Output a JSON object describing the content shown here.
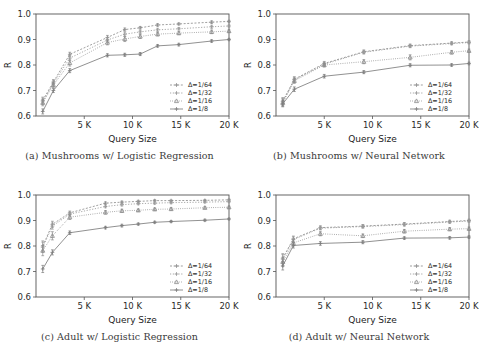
{
  "figure": {
    "background": "#ffffff",
    "panel_count": 4,
    "axis_color": "#555555"
  },
  "series_style": {
    "names": [
      "Δ=1/64",
      "Δ=1/32",
      "Δ=1/16",
      "Δ=1/8"
    ],
    "colors": [
      "#8e8e8e",
      "#9a9a9a",
      "#8a8a8a",
      "#7d7d7d"
    ],
    "dash": [
      "2,1.6",
      "1.2,1.6",
      "0.8,1.4",
      "none"
    ],
    "markers": [
      "plus",
      "plus",
      "triangle",
      "plus"
    ]
  },
  "axes_common": {
    "ylabel": "R",
    "xlabel": "Query Size",
    "ylim": [
      0.6,
      1.0
    ],
    "yticks": [
      "0.6",
      "0.7",
      "0.8",
      "0.9",
      "1.0"
    ],
    "ytick_values": [
      0.6,
      0.7,
      0.8,
      0.9,
      1.0
    ],
    "xlim": [
      0,
      20000
    ],
    "xticks": [
      "5 K",
      "10 K",
      "15 K",
      "20 K"
    ],
    "xtick_values": [
      5000,
      10000,
      15000,
      20000
    ],
    "grid": false,
    "legend_position": "lower right"
  },
  "chart_data": [
    {
      "type": "line",
      "panel": "a",
      "caption": "(a) Mushrooms w/ Logistic Regression",
      "title": "Mushrooms w/ Logistic Regression",
      "xlabel": "Query Size",
      "ylabel": "R",
      "xlim": [
        0,
        20000
      ],
      "ylim": [
        0.6,
        1.0
      ],
      "grid": false,
      "legend": [
        "Δ=1/64",
        "Δ=1/32",
        "Δ=1/16",
        "Δ=1/8"
      ],
      "x": [
        700,
        1800,
        3500,
        7400,
        9200,
        10800,
        12600,
        14800,
        18200,
        20000
      ],
      "series": [
        {
          "name": "Δ=1/64",
          "values": [
            0.662,
            0.733,
            0.842,
            0.908,
            0.939,
            0.946,
            0.957,
            0.961,
            0.968,
            0.971
          ],
          "err": [
            0.012,
            0.01,
            0.008,
            0.008,
            0.006,
            0.005,
            0.005,
            0.004,
            0.005,
            0.004
          ]
        },
        {
          "name": "Δ=1/32",
          "values": [
            0.658,
            0.728,
            0.827,
            0.898,
            0.921,
            0.93,
            0.938,
            0.942,
            0.95,
            0.953
          ],
          "err": [
            0.012,
            0.01,
            0.01,
            0.008,
            0.008,
            0.006,
            0.006,
            0.005,
            0.006,
            0.004
          ]
        },
        {
          "name": "Δ=1/16",
          "values": [
            0.652,
            0.722,
            0.808,
            0.888,
            0.902,
            0.912,
            0.921,
            0.925,
            0.93,
            0.933
          ],
          "err": [
            0.012,
            0.01,
            0.012,
            0.009,
            0.01,
            0.008,
            0.007,
            0.006,
            0.007,
            0.005
          ]
        },
        {
          "name": "Δ=1/8",
          "values": [
            0.618,
            0.7,
            0.778,
            0.838,
            0.84,
            0.843,
            0.875,
            0.88,
            0.894,
            0.9
          ],
          "err": [
            0.01,
            0.008,
            0.008,
            0.006,
            0.006,
            0.006,
            0.005,
            0.005,
            0.005,
            0.004
          ]
        }
      ]
    },
    {
      "type": "line",
      "panel": "b",
      "caption": "(b) Mushrooms w/ Neural Network",
      "title": "Mushrooms w/ Neural Network",
      "xlabel": "Query Size",
      "ylabel": "R",
      "xlim": [
        0,
        20000
      ],
      "ylim": [
        0.6,
        1.0
      ],
      "grid": false,
      "legend": [
        "Δ=1/64",
        "Δ=1/32",
        "Δ=1/16",
        "Δ=1/8"
      ],
      "x": [
        700,
        1900,
        5000,
        9100,
        13900,
        18200,
        20000
      ],
      "series": [
        {
          "name": "Δ=1/64",
          "values": [
            0.658,
            0.744,
            0.806,
            0.852,
            0.876,
            0.886,
            0.89
          ],
          "err": [
            0.014,
            0.01,
            0.008,
            0.007,
            0.006,
            0.005,
            0.005
          ]
        },
        {
          "name": "Δ=1/32",
          "values": [
            0.655,
            0.742,
            0.803,
            0.85,
            0.874,
            0.884,
            0.888
          ],
          "err": [
            0.014,
            0.01,
            0.008,
            0.007,
            0.006,
            0.005,
            0.005
          ]
        },
        {
          "name": "Δ=1/16",
          "values": [
            0.652,
            0.738,
            0.8,
            0.813,
            0.83,
            0.85,
            0.856
          ],
          "err": [
            0.014,
            0.01,
            0.008,
            0.008,
            0.01,
            0.007,
            0.006
          ]
        },
        {
          "name": "Δ=1/8",
          "values": [
            0.648,
            0.705,
            0.756,
            0.772,
            0.799,
            0.8,
            0.806
          ],
          "err": [
            0.012,
            0.009,
            0.007,
            0.006,
            0.006,
            0.005,
            0.005
          ]
        }
      ]
    },
    {
      "type": "line",
      "panel": "c",
      "caption": "(c) Adult w/ Logistic Regression",
      "title": "Adult w/ Logistic Regression",
      "xlabel": "Query Size",
      "ylabel": "R",
      "xlim": [
        0,
        20000
      ],
      "ylim": [
        0.6,
        1.0
      ],
      "grid": false,
      "legend": [
        "Δ=1/64",
        "Δ=1/32",
        "Δ=1/16",
        "Δ=1/8"
      ],
      "x": [
        700,
        1700,
        3500,
        7200,
        8900,
        10600,
        12300,
        14000,
        17500,
        20000
      ],
      "series": [
        {
          "name": "Δ=1/64",
          "values": [
            0.8,
            0.885,
            0.93,
            0.968,
            0.972,
            0.975,
            0.978,
            0.978,
            0.979,
            0.981
          ],
          "err": [
            0.02,
            0.012,
            0.007,
            0.005,
            0.004,
            0.004,
            0.004,
            0.003,
            0.003,
            0.003
          ]
        },
        {
          "name": "Δ=1/32",
          "values": [
            0.795,
            0.878,
            0.925,
            0.955,
            0.962,
            0.966,
            0.968,
            0.97,
            0.972,
            0.974
          ],
          "err": [
            0.02,
            0.012,
            0.008,
            0.005,
            0.005,
            0.004,
            0.004,
            0.004,
            0.003,
            0.003
          ]
        },
        {
          "name": "Δ=1/16",
          "values": [
            0.782,
            0.84,
            0.913,
            0.932,
            0.938,
            0.94,
            0.944,
            0.945,
            0.95,
            0.952
          ],
          "err": [
            0.02,
            0.016,
            0.009,
            0.007,
            0.006,
            0.005,
            0.005,
            0.005,
            0.004,
            0.004
          ]
        },
        {
          "name": "Δ=1/8",
          "values": [
            0.71,
            0.775,
            0.852,
            0.872,
            0.88,
            0.886,
            0.893,
            0.896,
            0.901,
            0.906
          ],
          "err": [
            0.014,
            0.01,
            0.007,
            0.005,
            0.005,
            0.004,
            0.004,
            0.004,
            0.004,
            0.003
          ]
        }
      ]
    },
    {
      "type": "line",
      "panel": "d",
      "caption": "(d) Adult w/ Neural Network",
      "title": "Adult w/ Neural Network",
      "xlabel": "Query Size",
      "ylabel": "R",
      "xlim": [
        0,
        20000
      ],
      "ylim": [
        0.6,
        1.0
      ],
      "grid": false,
      "legend": [
        "Δ=1/64",
        "Δ=1/32",
        "Δ=1/16",
        "Δ=1/8"
      ],
      "x": [
        700,
        1800,
        4600,
        9000,
        13300,
        18000,
        20000
      ],
      "series": [
        {
          "name": "Δ=1/64",
          "values": [
            0.752,
            0.828,
            0.872,
            0.878,
            0.886,
            0.896,
            0.9
          ],
          "err": [
            0.018,
            0.011,
            0.007,
            0.006,
            0.006,
            0.005,
            0.005
          ]
        },
        {
          "name": "Δ=1/32",
          "values": [
            0.748,
            0.825,
            0.87,
            0.876,
            0.884,
            0.894,
            0.898
          ],
          "err": [
            0.018,
            0.011,
            0.007,
            0.006,
            0.006,
            0.005,
            0.005
          ]
        },
        {
          "name": "Δ=1/16",
          "values": [
            0.738,
            0.812,
            0.848,
            0.84,
            0.858,
            0.866,
            0.868
          ],
          "err": [
            0.018,
            0.012,
            0.008,
            0.007,
            0.007,
            0.006,
            0.006
          ]
        },
        {
          "name": "Δ=1/8",
          "values": [
            0.722,
            0.802,
            0.81,
            0.815,
            0.831,
            0.832,
            0.835
          ],
          "err": [
            0.016,
            0.01,
            0.007,
            0.006,
            0.005,
            0.005,
            0.005
          ]
        }
      ]
    }
  ]
}
